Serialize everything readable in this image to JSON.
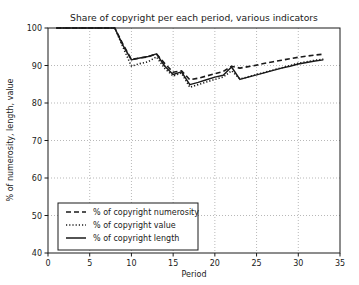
{
  "chart_data": {
    "type": "line",
    "title": "Share of copyright per each period, various indicators",
    "xlabel": "Period",
    "ylabel": "% of numerosity, length, value",
    "xlim": [
      0,
      35
    ],
    "ylim": [
      40,
      100
    ],
    "xticks": [
      0,
      5,
      10,
      15,
      20,
      25,
      30,
      35
    ],
    "yticks": [
      40,
      50,
      60,
      70,
      80,
      90,
      100
    ],
    "grid": true,
    "legend_position": "lower left",
    "x": [
      1,
      2,
      3,
      4,
      5,
      6,
      7,
      8,
      9,
      10,
      11,
      12,
      13,
      14,
      15,
      16,
      17,
      18,
      19,
      20,
      21,
      22,
      23,
      24,
      25,
      26,
      27,
      28,
      29,
      30,
      31,
      32,
      33
    ],
    "series": [
      {
        "name": "% of copyright numerosity",
        "style": "dashed",
        "color": "#1a1a1a",
        "values": [
          100,
          100,
          100,
          100,
          100,
          100,
          100,
          100,
          95.6,
          91.6,
          92.0,
          92.3,
          93.1,
          90.5,
          88.2,
          88.6,
          86.2,
          86.6,
          87.2,
          87.8,
          88.4,
          89.8,
          89.3,
          89.7,
          90.1,
          90.6,
          91.0,
          91.4,
          91.8,
          92.2,
          92.5,
          92.8,
          93.0
        ]
      },
      {
        "name": "% of copyright value",
        "style": "dotted",
        "color": "#1a1a1a",
        "values": [
          100,
          100,
          100,
          100,
          100,
          100,
          100,
          100,
          94.8,
          89.8,
          90.5,
          91.0,
          92.3,
          89.2,
          87.2,
          88.0,
          84.2,
          84.9,
          85.6,
          86.3,
          86.9,
          88.6,
          86.4,
          87.0,
          87.6,
          88.2,
          88.8,
          89.4,
          90.0,
          90.6,
          91.0,
          91.4,
          91.7
        ]
      },
      {
        "name": "% of copyright length",
        "style": "solid",
        "color": "#1a1a1a",
        "values": [
          100,
          100,
          100,
          100,
          100,
          100,
          100,
          100,
          95.3,
          91.5,
          92.0,
          92.4,
          93.1,
          89.8,
          87.6,
          88.3,
          84.9,
          85.5,
          86.2,
          86.9,
          87.4,
          89.6,
          86.3,
          86.9,
          87.5,
          88.1,
          88.7,
          89.3,
          89.8,
          90.4,
          90.8,
          91.2,
          91.5
        ]
      }
    ]
  },
  "legend": {
    "items": [
      {
        "label": "% of copyright numerosity"
      },
      {
        "label": "% of copyright value"
      },
      {
        "label": "% of copyright length"
      }
    ]
  }
}
